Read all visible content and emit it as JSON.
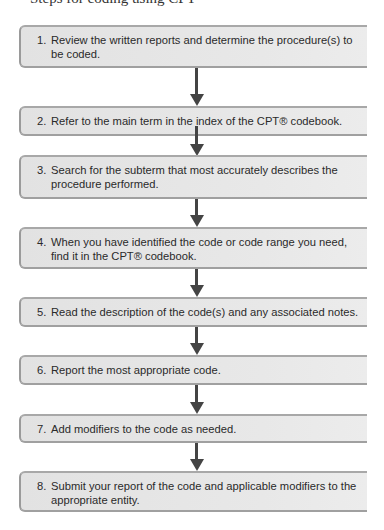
{
  "heading_partial": "Steps for coding using CPT",
  "steps": [
    {
      "number": "1.",
      "text": "Review the written reports and determine the procedure(s) to be coded."
    },
    {
      "number": "2.",
      "text": "Refer to the main term in the index of the CPT® codebook."
    },
    {
      "number": "3.",
      "text": "Search for the subterm that most accurately describes the procedure performed."
    },
    {
      "number": "4.",
      "text": "When you have identified the code or code range you need, find it in the CPT® codebook."
    },
    {
      "number": "5.",
      "text": "Read the description of the code(s) and any associated notes."
    },
    {
      "number": "6.",
      "text": "Report the most appropriate code."
    },
    {
      "number": "7.",
      "text": "Add modifiers to the code as needed."
    },
    {
      "number": "8.",
      "text": "Submit your report of the code and applicable modifiers to the appropriate entity."
    }
  ],
  "colors": {
    "box_fill": "#e6e6e6",
    "box_border": "#9a9a9a",
    "arrow": "#444444"
  }
}
